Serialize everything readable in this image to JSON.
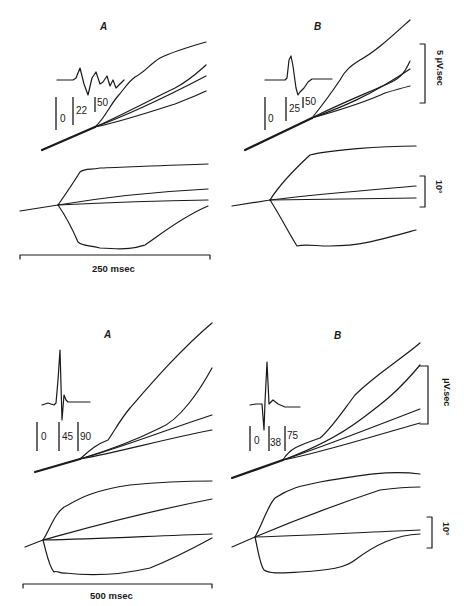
{
  "figure": {
    "top_row": {
      "panels": [
        {
          "letter": "A",
          "waveform_ticks": [
            "0",
            "22",
            "50"
          ]
        },
        {
          "letter": "B",
          "waveform_ticks": [
            "0",
            "25",
            "50"
          ]
        }
      ],
      "integral_scale_label": "5 μV.sec",
      "angle_scale_label": "10°",
      "time_scale_label": "250 msec"
    },
    "bottom_row": {
      "panels": [
        {
          "letter": "A",
          "waveform_ticks": [
            "0",
            "45",
            "90"
          ]
        },
        {
          "letter": "B",
          "waveform_ticks": [
            "0",
            "38",
            "75"
          ]
        }
      ],
      "integral_scale_label": "μV.sec",
      "angle_scale_label": "10°",
      "time_scale_label": "500 msec"
    }
  }
}
